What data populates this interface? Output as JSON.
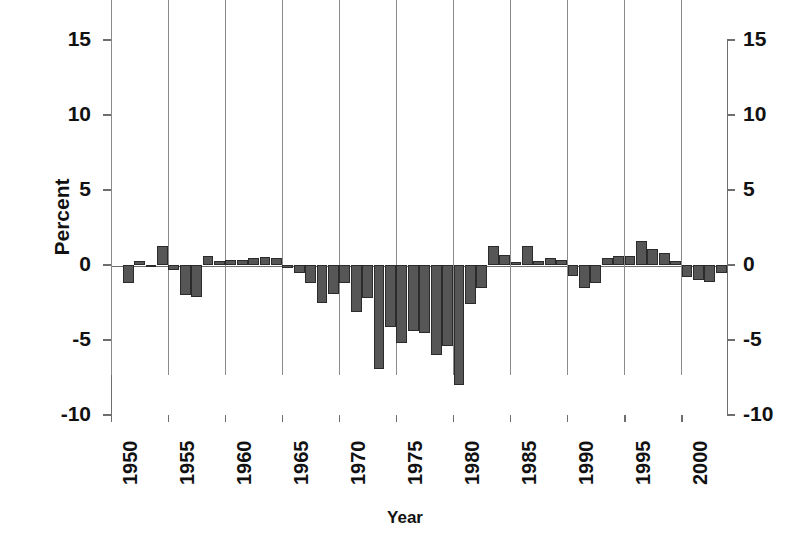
{
  "chart_data": {
    "type": "bar",
    "title": "",
    "xlabel": "Year",
    "ylabel": "Percent",
    "ylim": [
      -10,
      15
    ],
    "yticks": [
      15,
      10,
      5,
      0,
      -5,
      -10
    ],
    "xlim": [
      1950,
      2004
    ],
    "xticks": [
      1950,
      1955,
      1960,
      1965,
      1970,
      1975,
      1980,
      1985,
      1990,
      1995,
      2000
    ],
    "grid": "vertical gridlines at x ticks",
    "legend": "none",
    "bar_color": "#565656",
    "bar_edge_color": "#2b2b2b",
    "axis_color": "#6e6e6e",
    "dual_axis": true,
    "right_axis_ticks": [
      15,
      10,
      5,
      0,
      -5,
      -10
    ],
    "categories": [
      1951,
      1952,
      1953,
      1954,
      1955,
      1956,
      1957,
      1958,
      1959,
      1960,
      1961,
      1962,
      1963,
      1964,
      1965,
      1966,
      1967,
      1968,
      1969,
      1970,
      1971,
      1972,
      1973,
      1974,
      1975,
      1976,
      1977,
      1978,
      1979,
      1980,
      1981,
      1982,
      1983,
      1984,
      1985,
      1986,
      1987,
      1988,
      1989,
      1990,
      1991,
      1992,
      1993,
      1994,
      1995,
      1996,
      1997,
      1998,
      1999,
      2000,
      2001,
      2002,
      2003
    ],
    "values": [
      -1.2,
      0.3,
      -0.1,
      1.3,
      -0.3,
      -2.0,
      -2.1,
      0.6,
      0.25,
      0.35,
      0.35,
      0.45,
      0.55,
      0.45,
      -0.2,
      -0.5,
      -1.2,
      -2.5,
      -1.9,
      -1.2,
      -3.1,
      -2.2,
      -6.9,
      -4.1,
      -5.2,
      -4.4,
      -4.5,
      -6.0,
      -5.4,
      -8.0,
      -2.6,
      -1.5,
      1.3,
      0.7,
      0.2,
      1.3,
      0.3,
      0.5,
      0.35,
      -0.7,
      -1.5,
      -1.2,
      0.5,
      0.6,
      0.6,
      1.6,
      1.1,
      0.8,
      0.25,
      -0.8,
      -1.0,
      -1.1,
      -0.5
    ]
  },
  "axes": {
    "y_title": "Percent",
    "x_title": "Year",
    "y_tick_labels": [
      "15",
      "10",
      "5",
      "0",
      "-5",
      "-10"
    ],
    "y_tick_labels_right": [
      "15",
      "10",
      "5",
      "0",
      "-5",
      "-10"
    ],
    "x_tick_labels": [
      "1950",
      "1955",
      "1960",
      "1965",
      "1970",
      "1975",
      "1980",
      "1985",
      "1990",
      "1995",
      "2000"
    ]
  }
}
